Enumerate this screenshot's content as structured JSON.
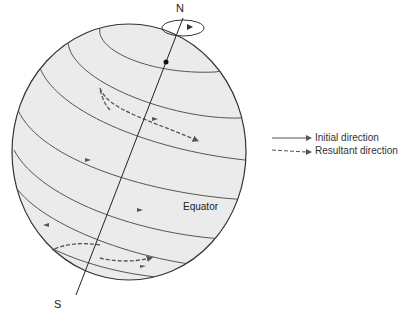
{
  "diagram": {
    "labels": {
      "north": "N",
      "south": "S",
      "equator": "Equator"
    },
    "legend": [
      {
        "label": "Initial direction",
        "style": "solid"
      },
      {
        "label": "Resultant direction",
        "style": "dashed"
      }
    ],
    "colors": {
      "globe_fill": "#ebebeb",
      "globe_outline": "#333333",
      "latitude_lines": "#555555",
      "axis": "#222222",
      "legend_text": "#333333"
    }
  }
}
